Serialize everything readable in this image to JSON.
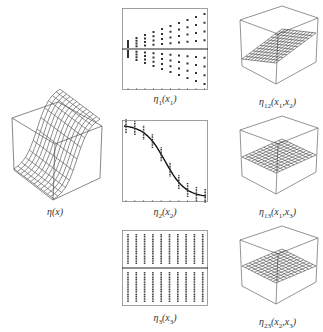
{
  "chart_data": [
    {
      "type": "surface",
      "title": "η(x)",
      "label": {
        "base": "η",
        "sub": "",
        "args": "(x)"
      },
      "description": "3D wireframe surface in a box; sigmoid-shaped rise along one axis"
    },
    {
      "type": "scatter",
      "title": "η1(x1)",
      "label": {
        "base": "η",
        "sub": "1",
        "args": "(x",
        "argsub": "1",
        "close": ")"
      },
      "columns": 10,
      "hline": 0,
      "description": "Columns of points spreading with increasing x1; horizontal zero line"
    },
    {
      "type": "line",
      "title": "η2(x2)",
      "label": {
        "base": "η",
        "sub": "2",
        "args": "(x",
        "argsub": "2",
        "close": ")"
      },
      "x": [
        0,
        1,
        2,
        3,
        4,
        5,
        6,
        7,
        8,
        9
      ],
      "values": [
        0.9,
        0.85,
        0.75,
        0.55,
        0.2,
        -0.2,
        -0.55,
        -0.75,
        -0.85,
        -0.9
      ],
      "description": "Decreasing sigmoid curve with vertical point clusters at sample x"
    },
    {
      "type": "scatter",
      "title": "η3(x3)",
      "label": {
        "base": "η",
        "sub": "3",
        "args": "(x",
        "argsub": "3",
        "close": ")"
      },
      "columns": 10,
      "hline": 0,
      "description": "Ten vertical columns of dense points; horizontal zero line"
    },
    {
      "type": "surface",
      "title": "η12(x1,x2)",
      "label": {
        "base": "η",
        "sub": "12",
        "args": "(x",
        "argsub": "1",
        "mid": ",x",
        "argsub2": "2",
        "close": ")"
      },
      "description": "Tilted planar wireframe surface in 3D box"
    },
    {
      "type": "surface",
      "title": "η13(x1,x3)",
      "label": {
        "base": "η",
        "sub": "13",
        "args": "(x",
        "argsub": "1",
        "mid": ",x",
        "argsub2": "3",
        "close": ")"
      },
      "description": "Nearly flat wireframe surface in 3D box"
    },
    {
      "type": "surface",
      "title": "η23(x2,x3)",
      "label": {
        "base": "η",
        "sub": "23",
        "args": "(x",
        "argsub": "2",
        "mid": ",x",
        "argsub2": "3",
        "close": ")"
      },
      "description": "Nearly flat wireframe surface in 3D box"
    }
  ]
}
